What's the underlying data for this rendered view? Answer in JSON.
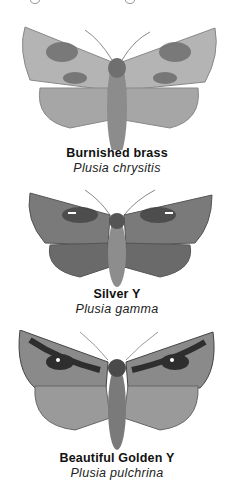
{
  "plate": {
    "species": [
      {
        "common_name": "Burnished brass",
        "latin_name": "Plusia chrysitis",
        "wing_tone": "#9a9a9a",
        "mark_tone": "#5a5a5a"
      },
      {
        "common_name": "Silver Y",
        "latin_name": "Plusia gamma",
        "wing_tone": "#7a7a7a",
        "mark_tone": "#3a3a3a"
      },
      {
        "common_name": "Beautiful Golden Y",
        "latin_name": "Plusia pulchrina",
        "wing_tone": "#8a8a8a",
        "mark_tone": "#2e2e2e"
      }
    ]
  }
}
